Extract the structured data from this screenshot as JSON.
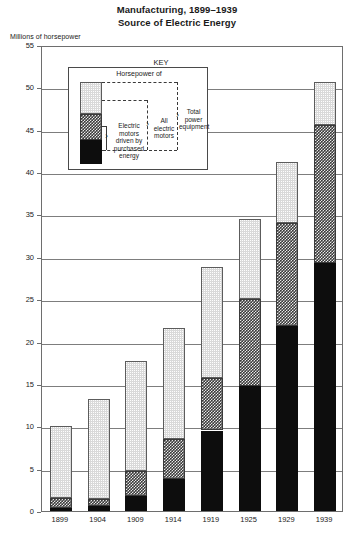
{
  "title": {
    "line1": "Manufacturing, 1899–1939",
    "line2": "Source of Electric Energy"
  },
  "axis_caption": "Millions of horsepower",
  "key": {
    "heading": "KEY",
    "top_label": "Horsepower of",
    "seg_black_label": "Electric\nmotors\ndriven by\npurchased\nenergy",
    "seg_black_label_lines": [
      "Electric",
      "motors",
      "driven by",
      "purchased",
      "energy"
    ],
    "seg_mid_label_lines": [
      "All",
      "electric",
      "motors"
    ],
    "seg_top_label_lines": [
      "Total",
      "power",
      "equipment"
    ]
  },
  "chart_data": {
    "type": "bar",
    "subtitle": "Source of Electric Energy",
    "xlabel": "",
    "ylabel": "Millions of horsepower",
    "ylim": [
      0,
      55
    ],
    "ytick_step": 5,
    "yticks": [
      0,
      5,
      10,
      15,
      20,
      25,
      30,
      35,
      40,
      45,
      50,
      55
    ],
    "grid": true,
    "legend_position": "inside-top-left",
    "stacked": true,
    "categories": [
      "1899",
      "1904",
      "1909",
      "1914",
      "1919",
      "1925",
      "1929",
      "1939"
    ],
    "series": [
      {
        "name": "Electric motors driven by purchased energy",
        "pattern": "solid-black",
        "color": "#0d0d0d",
        "values": [
          0.3,
          0.6,
          1.8,
          3.8,
          9.5,
          14.7,
          21.8,
          29.3
        ]
      },
      {
        "name": "Electric motors driven by generated energy",
        "pattern": "checkered",
        "color": "#3a3a3a",
        "values": [
          1.2,
          0.8,
          2.9,
          4.7,
          6.2,
          10.3,
          12.2,
          16.2
        ]
      },
      {
        "name": "Other (non-electric) power equipment",
        "pattern": "light-stipple",
        "color": "#d9d9d9",
        "values": [
          8.5,
          11.8,
          13.0,
          13.1,
          13.1,
          9.5,
          7.2,
          5.1
        ]
      }
    ],
    "totals": {
      "label": "Total power equipment",
      "values": [
        10.0,
        13.2,
        17.7,
        21.6,
        28.8,
        34.5,
        41.2,
        50.6
      ]
    },
    "all_electric_motors": {
      "label": "All electric motors",
      "values": [
        1.5,
        1.4,
        4.7,
        8.5,
        15.7,
        25.0,
        34.0,
        45.5
      ]
    }
  }
}
